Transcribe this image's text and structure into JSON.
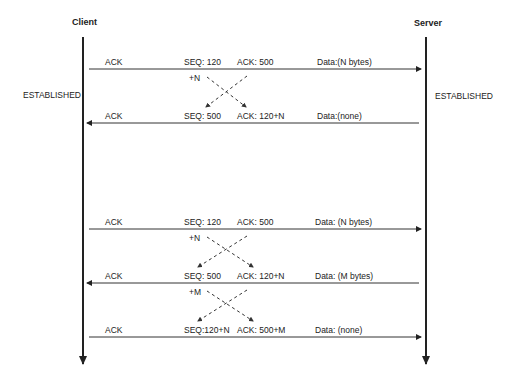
{
  "participants": {
    "client": {
      "label": "Client",
      "state": "ESTABLISHED"
    },
    "server": {
      "label": "Server",
      "state": "ESTABLISHED"
    }
  },
  "messages": [
    {
      "direction": "client-to-server",
      "flag": "ACK",
      "seq": "SEQ: 120",
      "ack": "ACK: 500",
      "data": "Data:(N bytes)",
      "cross_label": "+N"
    },
    {
      "direction": "server-to-client",
      "flag": "ACK",
      "seq": "SEQ: 500",
      "ack": "ACK: 120+N",
      "data": "Data:(none)"
    },
    {
      "direction": "client-to-server",
      "flag": "ACK",
      "seq": "SEQ: 120",
      "ack": "ACK: 500",
      "data": "Data: (N bytes)",
      "cross_label": "+N"
    },
    {
      "direction": "server-to-client",
      "flag": "ACK",
      "seq": "SEQ: 500",
      "ack": "ACK: 120+N",
      "data": "Data: (M bytes)",
      "cross_label": "+M"
    },
    {
      "direction": "client-to-server",
      "flag": "ACK",
      "seq": "SEQ:120+N",
      "ack": "ACK: 500+M",
      "data": "Data: (none)"
    }
  ],
  "colors": {
    "line": "#222222",
    "background": "#ffffff"
  }
}
